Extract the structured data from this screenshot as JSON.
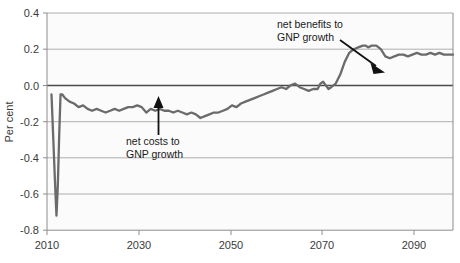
{
  "chart_data": {
    "type": "line",
    "title": "",
    "xlabel": "",
    "ylabel": "Per cent",
    "xlim": [
      2010,
      2100
    ],
    "ylim": [
      -0.8,
      0.4
    ],
    "xticks": [
      2010,
      2030,
      2050,
      2070,
      2090
    ],
    "xtick_labels": [
      "2010",
      "2030",
      "2050",
      "2070",
      "2090"
    ],
    "yticks": [
      -0.8,
      -0.6,
      -0.4,
      -0.2,
      0.0,
      0.2,
      0.4
    ],
    "ytick_labels": [
      "-0.8",
      "-0.6",
      "-0.4",
      "-0.2",
      "0.0",
      "0.2",
      "0.4"
    ],
    "grid": true,
    "legend": "none",
    "series": [
      {
        "name": "net effect on GNP growth",
        "color": "#6b6b6b",
        "x": [
          2011.0,
          2011.4,
          2011.8,
          2012.1,
          2012.4,
          2012.7,
          2013.0,
          2013.4,
          2014.0,
          2015.0,
          2016.0,
          2017.0,
          2018.0,
          2019.0,
          2020.0,
          2021.0,
          2022.0,
          2023.0,
          2024.0,
          2025.0,
          2026.0,
          2027.0,
          2028.0,
          2029.0,
          2030.0,
          2031.0,
          2032.0,
          2033.0,
          2034.0,
          2035.0,
          2036.0,
          2037.0,
          2038.0,
          2039.0,
          2040.0,
          2041.0,
          2042.0,
          2043.0,
          2044.0,
          2045.0,
          2046.0,
          2047.0,
          2048.0,
          2049.0,
          2050.0,
          2051.0,
          2052.0,
          2053.0,
          2054.0,
          2055.0,
          2056.0,
          2057.0,
          2058.0,
          2059.0,
          2060.0,
          2061.0,
          2062.0,
          2063.0,
          2064.0,
          2065.0,
          2066.0,
          2067.0,
          2068.0,
          2069.0,
          2070.0,
          2070.6,
          2071.2,
          2071.8,
          2072.4,
          2073.0,
          2074.0,
          2075.0,
          2076.0,
          2077.0,
          2078.0,
          2079.0,
          2080.0,
          2080.6,
          2081.2,
          2082.0,
          2083.0,
          2084.0,
          2085.0,
          2086.0,
          2087.0,
          2088.0,
          2089.0,
          2090.0,
          2091.0,
          2092.0,
          2093.0,
          2094.0,
          2095.0,
          2096.0,
          2097.0,
          2098.0,
          2099.0,
          2100.0
        ],
        "y": [
          -0.05,
          -0.3,
          -0.55,
          -0.72,
          -0.55,
          -0.28,
          -0.05,
          -0.05,
          -0.07,
          -0.09,
          -0.1,
          -0.12,
          -0.11,
          -0.13,
          -0.14,
          -0.13,
          -0.14,
          -0.15,
          -0.14,
          -0.13,
          -0.14,
          -0.13,
          -0.12,
          -0.12,
          -0.11,
          -0.12,
          -0.15,
          -0.13,
          -0.14,
          -0.13,
          -0.14,
          -0.14,
          -0.15,
          -0.14,
          -0.15,
          -0.16,
          -0.15,
          -0.16,
          -0.18,
          -0.17,
          -0.16,
          -0.15,
          -0.15,
          -0.14,
          -0.13,
          -0.11,
          -0.12,
          -0.1,
          -0.09,
          -0.08,
          -0.07,
          -0.06,
          -0.05,
          -0.04,
          -0.03,
          -0.02,
          -0.01,
          -0.02,
          0.0,
          0.01,
          -0.01,
          -0.02,
          -0.03,
          -0.02,
          -0.02,
          0.01,
          0.02,
          0.0,
          -0.02,
          -0.01,
          0.01,
          0.06,
          0.13,
          0.18,
          0.2,
          0.21,
          0.22,
          0.22,
          0.21,
          0.22,
          0.22,
          0.2,
          0.16,
          0.15,
          0.16,
          0.17,
          0.17,
          0.16,
          0.17,
          0.18,
          0.17,
          0.17,
          0.18,
          0.17,
          0.18,
          0.17,
          0.17,
          0.17
        ]
      }
    ],
    "annotations": [
      {
        "name": "net-costs-annotation",
        "text_line1": "net costs to",
        "text_line2": "GNP growth",
        "arrow": "up",
        "points_to_year": 2034,
        "points_to_value": -0.13
      },
      {
        "name": "net-benefits-annotation",
        "text_line1": "net benefits to",
        "text_line2": "GNP growth",
        "arrow": "down-right",
        "points_to_year": 2083,
        "points_to_value": 0.1
      }
    ]
  }
}
